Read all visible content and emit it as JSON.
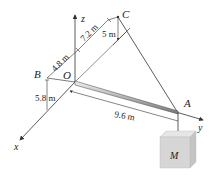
{
  "diagram": {
    "points": {
      "O": "O",
      "A": "A",
      "B": "B",
      "C": "C"
    },
    "axes": {
      "x": "x",
      "y": "y",
      "z": "z"
    },
    "dimensions": {
      "ob": "4.8 m",
      "oc_z": "7.2 m",
      "c_drop": "5 m",
      "b_drop": "5.8 m",
      "oa": "9.6 m"
    },
    "mass_label": "M",
    "colors": {
      "line": "#333333",
      "boom": "#555555",
      "block_front": "#d6d6d6",
      "block_top": "#e6e6e6",
      "block_side": "#c4c4c4"
    }
  }
}
